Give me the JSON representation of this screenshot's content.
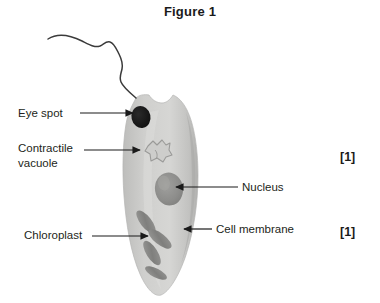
{
  "figure": {
    "title": "Figure 1"
  },
  "labels": {
    "eye_spot": "Eye spot",
    "contractile_vacuole_line1": "Contractile",
    "contractile_vacuole_line2": "vacuole",
    "chloroplast": "Chloroplast",
    "nucleus": "Nucleus",
    "cell_membrane": "Cell membrane"
  },
  "marks": {
    "mark_1": "[1]",
    "mark_2": "[1]"
  },
  "colors": {
    "cell_body": "#c9c9c7",
    "cell_body_shade": "#b4b4b2",
    "cell_body_highlight": "#dedede",
    "eye_spot": "#1c1c1c",
    "nucleus": "#8f8f8d",
    "chloroplast": "#8a8a88",
    "vacuole_outline": "#9a9a98",
    "flagellum": "#3b3b3b",
    "leader_line": "#1a1a1a",
    "text": "#231f20",
    "background": "#ffffff"
  },
  "structures": [
    {
      "name": "flagellum",
      "label": null
    },
    {
      "name": "eye-spot",
      "label": "Eye spot"
    },
    {
      "name": "contractile-vacuole",
      "label": "Contractile vacuole"
    },
    {
      "name": "nucleus",
      "label": "Nucleus"
    },
    {
      "name": "chloroplast",
      "label": "Chloroplast"
    },
    {
      "name": "cell-membrane",
      "label": "Cell membrane"
    }
  ]
}
